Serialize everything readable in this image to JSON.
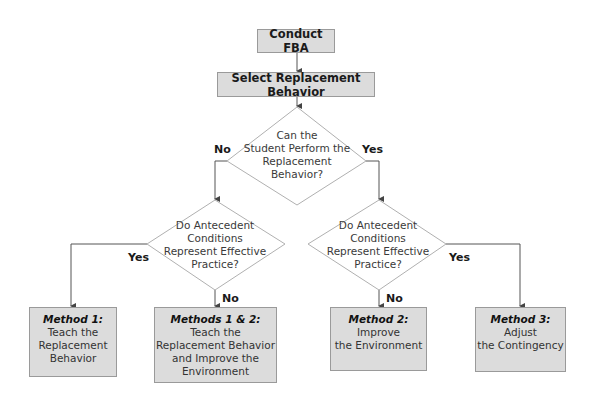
{
  "nodes": {
    "start": {
      "label": "Conduct FBA"
    },
    "select": {
      "label": "Select Replacement Behavior"
    },
    "decision_perform": {
      "label": "Can the\nStudent Perform the\nReplacement\nBehavior?"
    },
    "decision_left": {
      "label": "Do Antecedent\nConditions\nRepresent Effective\nPractice?"
    },
    "decision_right": {
      "label": "Do Antecedent\nConditions\nRepresent Effective\nPractice?"
    },
    "method1": {
      "head": "Method 1:",
      "body": "Teach the\nReplacement\nBehavior"
    },
    "method12": {
      "head": "Methods 1 & 2:",
      "body": "Teach the\nReplacement Behavior\nand Improve the\nEnvironment"
    },
    "method2": {
      "head": "Method 2:",
      "body": "Improve\nthe Environment"
    },
    "method3": {
      "head": "Method 3:",
      "body": "Adjust\nthe Contingency"
    }
  },
  "edges": {
    "perform_no": "No",
    "perform_yes": "Yes",
    "left_yes": "Yes",
    "left_no": "No",
    "right_no": "No",
    "right_yes": "Yes"
  },
  "colors": {
    "box_fill": "#dcdcdc",
    "box_border": "#9a9a9a",
    "line": "#555555",
    "diamond_border": "#b0b0b0"
  }
}
